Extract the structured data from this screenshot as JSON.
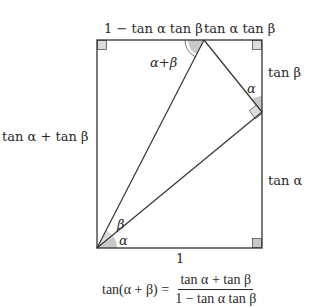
{
  "diagram": {
    "type": "trigonometric-proof-rectangle",
    "colors": {
      "stroke": "#333333",
      "angle_fill": "#c8c8c8",
      "text": "#2a2a2a",
      "background": "#ffffff"
    },
    "labels": {
      "top_left_segment": "1 − tan α tan β",
      "top_right_segment": "tan α tan β",
      "right_upper_segment": "tan β",
      "right_lower_segment": "tan α",
      "left_side": "tan α + tan β",
      "bottom_side": "1",
      "angle_top": "α+β",
      "angle_right": "α",
      "angle_bottom_beta": "β",
      "angle_bottom_alpha": "α"
    },
    "formula": {
      "lhs": "tan(α + β) =",
      "numerator": "tan α + tan β",
      "denominator": "1 − tan α tan β"
    }
  }
}
